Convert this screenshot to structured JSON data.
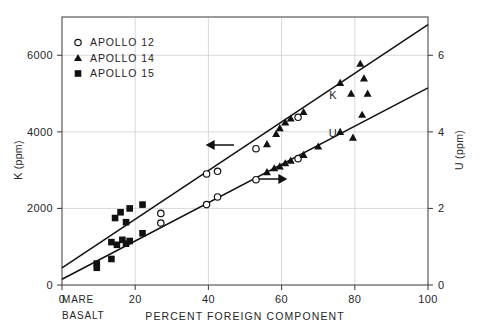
{
  "chart_data": {
    "type": "scatter",
    "title": "",
    "xlabel": "PERCENT FOREIGN COMPONENT",
    "ylabel": "K (ppm)",
    "y2label": "U (ppm)",
    "xlim": [
      0,
      100
    ],
    "ylim": [
      0,
      7000
    ],
    "y2lim": [
      0,
      7
    ],
    "xticks": [
      0,
      20,
      40,
      60,
      80,
      100
    ],
    "xticklabels": [
      "0",
      "20",
      "40",
      "60",
      "80",
      "100"
    ],
    "yticks": [
      0,
      2000,
      4000,
      6000
    ],
    "yticklabels": [
      "0",
      "2000",
      "4000",
      "6000"
    ],
    "y2ticks": [
      0,
      2,
      4,
      6
    ],
    "y2ticklabels": [
      "0",
      "2",
      "4",
      "6"
    ],
    "grid": true,
    "origin_annotation_line1": "MARE",
    "origin_annotation_line2": "BASALT",
    "legend_position": "upper-left",
    "legend": [
      {
        "label": "APOLLO 12",
        "marker": "open-circle"
      },
      {
        "label": "APOLLO 14",
        "marker": "filled-triangle"
      },
      {
        "label": "APOLLO 15",
        "marker": "filled-square"
      }
    ],
    "series": [
      {
        "name": "K (ppm)",
        "axis": "left",
        "label_on_plot": "K",
        "arrow_direction": "left",
        "fit_line": {
          "x0": 0,
          "y0": 450,
          "x1": 100,
          "y1": 6800
        },
        "points": [
          {
            "x": 9.5,
            "y": 560,
            "marker": "filled-square"
          },
          {
            "x": 13.5,
            "y": 1120,
            "marker": "filled-square"
          },
          {
            "x": 14.5,
            "y": 1750,
            "marker": "filled-square"
          },
          {
            "x": 16.0,
            "y": 1900,
            "marker": "filled-square"
          },
          {
            "x": 17.5,
            "y": 1640,
            "marker": "filled-square"
          },
          {
            "x": 18.5,
            "y": 2000,
            "marker": "filled-square"
          },
          {
            "x": 22.0,
            "y": 2100,
            "marker": "filled-square"
          },
          {
            "x": 27.0,
            "y": 1870,
            "marker": "open-circle"
          },
          {
            "x": 39.5,
            "y": 2900,
            "marker": "open-circle"
          },
          {
            "x": 42.5,
            "y": 2970,
            "marker": "open-circle"
          },
          {
            "x": 53.0,
            "y": 3560,
            "marker": "open-circle"
          },
          {
            "x": 56.0,
            "y": 3680,
            "marker": "filled-triangle"
          },
          {
            "x": 58.5,
            "y": 3950,
            "marker": "filled-triangle"
          },
          {
            "x": 59.5,
            "y": 4100,
            "marker": "filled-triangle"
          },
          {
            "x": 61.0,
            "y": 4250,
            "marker": "filled-triangle"
          },
          {
            "x": 62.5,
            "y": 4350,
            "marker": "filled-triangle"
          },
          {
            "x": 64.5,
            "y": 4380,
            "marker": "open-circle"
          },
          {
            "x": 66.0,
            "y": 4520,
            "marker": "filled-triangle"
          },
          {
            "x": 76.0,
            "y": 5280,
            "marker": "filled-triangle"
          },
          {
            "x": 79.0,
            "y": 5000,
            "marker": "filled-triangle"
          },
          {
            "x": 81.5,
            "y": 5780,
            "marker": "filled-triangle"
          },
          {
            "x": 82.5,
            "y": 5400,
            "marker": "filled-triangle"
          },
          {
            "x": 83.5,
            "y": 5000,
            "marker": "filled-triangle"
          }
        ]
      },
      {
        "name": "U (ppm)",
        "axis": "right",
        "label_on_plot": "U",
        "arrow_direction": "right",
        "fit_line": {
          "x0": 0,
          "y0": 0.15,
          "x1": 100,
          "y1": 5.15
        },
        "points": [
          {
            "x": 9.5,
            "y": 0.45,
            "marker": "filled-square"
          },
          {
            "x": 13.5,
            "y": 0.68,
            "marker": "filled-square"
          },
          {
            "x": 15.0,
            "y": 1.05,
            "marker": "filled-square"
          },
          {
            "x": 16.5,
            "y": 1.18,
            "marker": "filled-square"
          },
          {
            "x": 17.5,
            "y": 1.08,
            "marker": "filled-square"
          },
          {
            "x": 18.5,
            "y": 1.15,
            "marker": "filled-square"
          },
          {
            "x": 22.0,
            "y": 1.35,
            "marker": "filled-square"
          },
          {
            "x": 27.0,
            "y": 1.62,
            "marker": "open-circle"
          },
          {
            "x": 39.5,
            "y": 2.1,
            "marker": "open-circle"
          },
          {
            "x": 42.5,
            "y": 2.3,
            "marker": "open-circle"
          },
          {
            "x": 53.0,
            "y": 2.75,
            "marker": "open-circle"
          },
          {
            "x": 56.0,
            "y": 2.95,
            "marker": "filled-triangle"
          },
          {
            "x": 58.0,
            "y": 3.05,
            "marker": "filled-triangle"
          },
          {
            "x": 59.5,
            "y": 3.1,
            "marker": "filled-triangle"
          },
          {
            "x": 61.0,
            "y": 3.18,
            "marker": "filled-triangle"
          },
          {
            "x": 62.5,
            "y": 3.25,
            "marker": "filled-triangle"
          },
          {
            "x": 64.5,
            "y": 3.3,
            "marker": "open-circle"
          },
          {
            "x": 66.0,
            "y": 3.4,
            "marker": "filled-triangle"
          },
          {
            "x": 70.0,
            "y": 3.62,
            "marker": "filled-triangle"
          },
          {
            "x": 76.0,
            "y": 4.0,
            "marker": "filled-triangle"
          },
          {
            "x": 79.5,
            "y": 3.85,
            "marker": "filled-triangle"
          },
          {
            "x": 82.0,
            "y": 4.45,
            "marker": "filled-triangle"
          }
        ]
      }
    ]
  }
}
